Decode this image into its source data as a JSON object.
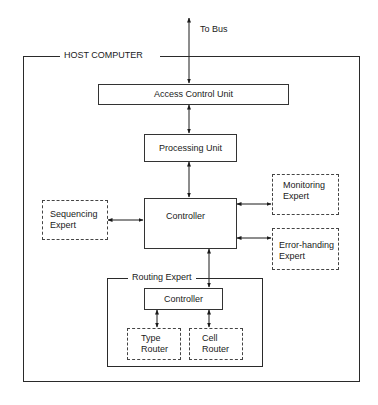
{
  "diagram": {
    "bus_label": "To Bus",
    "host": {
      "label": "HOST COMPUTER"
    },
    "access_control_unit": {
      "label": "Access Control Unit"
    },
    "processing_unit": {
      "label": "Processing Unit"
    },
    "controller": {
      "label": "Controller"
    },
    "sequencing_expert": {
      "line1": "Sequencing",
      "line2": "Expert"
    },
    "monitoring_expert": {
      "line1": "Monitoring",
      "line2": "Expert"
    },
    "error_handling_expert": {
      "line1": "Error-handing",
      "line2": "Expert"
    },
    "routing_expert": {
      "label": "Routing Expert",
      "controller": {
        "label": "Controller"
      },
      "type_router": {
        "line1": "Type",
        "line2": "Router"
      },
      "cell_router": {
        "line1": "Cell",
        "line2": "Router"
      }
    },
    "colors": {
      "line": "#2a2a2a",
      "background": "#ffffff"
    }
  }
}
